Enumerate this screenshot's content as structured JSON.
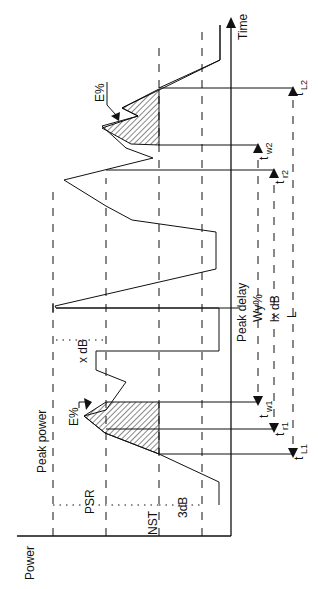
{
  "diagram": {
    "orientation": "rotated 90 degrees counter-clockwise",
    "axes": {
      "power_label": "Power",
      "time_label": "Time"
    },
    "levels": {
      "peak_power": "Peak power",
      "psr": "PSR",
      "nst": "NST",
      "three_db": "3dB",
      "x_db": "x dB"
    },
    "annotations": {
      "energy_top": "E%",
      "energy_bottom": "E%",
      "peak_delay": "Peak delay",
      "wy": "Wy%",
      "lx_db": "lx dB",
      "l": "L"
    },
    "time_markers": {
      "tw1": {
        "main": "t",
        "sub": "w1"
      },
      "tr1": {
        "main": "t",
        "sub": "r1"
      },
      "tl1": {
        "main": "t",
        "sub": "L1"
      },
      "tw2": {
        "main": "t",
        "sub": "w2"
      },
      "tr2": {
        "main": "t",
        "sub": "r2"
      },
      "tl2": {
        "main": "t",
        "sub": "L2"
      }
    }
  }
}
